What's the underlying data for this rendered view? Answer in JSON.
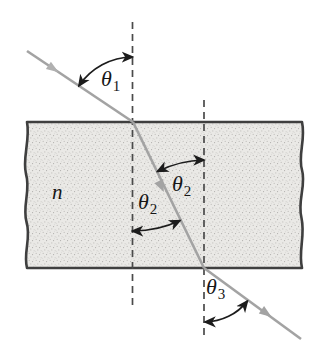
{
  "figure": {
    "description_labels": {
      "theta1": {
        "base": "θ",
        "sub": "1"
      },
      "theta2_entry": {
        "base": "θ",
        "sub": "2"
      },
      "theta2_exit": {
        "base": "θ",
        "sub": "2"
      },
      "theta3": {
        "base": "θ",
        "sub": "3"
      },
      "medium_index": {
        "base": "n",
        "sub": ""
      }
    },
    "colors": {
      "background": "#ffffff",
      "ray": "#a3a3a3",
      "slab_fill": "#eae9e6",
      "slab_speckle": "#c2c0bd",
      "slab_speckle_dark": "#a9a7a4",
      "slab_border": "#3f3f3f",
      "dashed_normal": "#4a4a4a",
      "angle_arc": "#1c1c1c",
      "label_text": "#161616"
    }
  }
}
